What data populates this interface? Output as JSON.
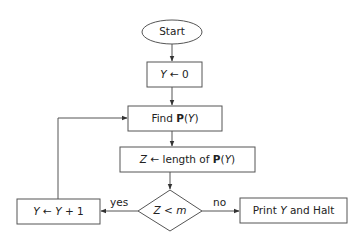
{
  "diagram": {
    "type": "flowchart",
    "nodes": {
      "start": {
        "label": "Start",
        "shape": "ellipse"
      },
      "init": {
        "var": "Y",
        "arrow": "←",
        "value": "0",
        "shape": "rectangle"
      },
      "find": {
        "prefix": "Find ",
        "func": "P",
        "arg_open": "(",
        "arg": "Y",
        "arg_close": ")",
        "shape": "rectangle"
      },
      "assign": {
        "var": "Z",
        "arrow": "←",
        "text": " length of ",
        "func": "P",
        "arg_open": "(",
        "arg": "Y",
        "arg_close": ")",
        "shape": "rectangle"
      },
      "decision": {
        "lhs": "Z",
        "op": " < ",
        "rhs": "m",
        "shape": "diamond"
      },
      "increment": {
        "var": "Y",
        "arrow": "←",
        "expr_var": "Y",
        "expr_rest": " + 1",
        "shape": "rectangle"
      },
      "halt": {
        "prefix": "Print ",
        "var": "Y",
        "suffix": " and Halt",
        "shape": "rectangle"
      }
    },
    "edges": {
      "yes_label": "yes",
      "no_label": "no"
    },
    "colors": {
      "stroke": "#555555",
      "text": "#222222",
      "background": "#ffffff"
    }
  }
}
